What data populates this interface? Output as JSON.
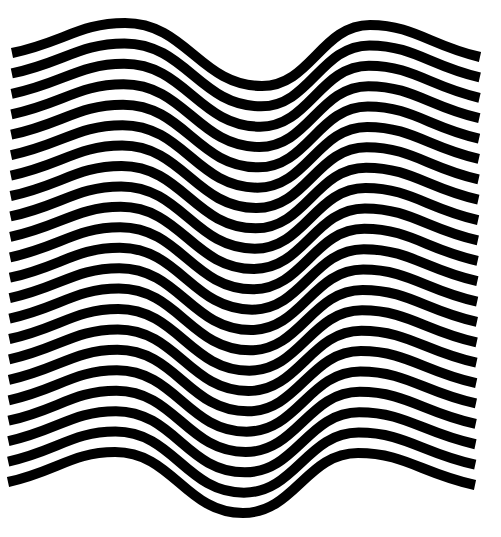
{
  "artwork": {
    "title": "Wavy black stripes op-art pattern",
    "background_color": "#ffffff",
    "stripe_color": "#000000",
    "stripe_count": 22,
    "stroke_width": 10,
    "top_stripe": {
      "start": [
        12,
        53
      ],
      "peak_left": [
        125,
        23
      ],
      "trough": [
        262,
        86
      ],
      "peak_right": [
        370,
        25
      ],
      "end": [
        480,
        57
      ]
    },
    "bottom_stripe": {
      "start": [
        8,
        482
      ],
      "peak_left": [
        115,
        452
      ],
      "trough": [
        243,
        513
      ],
      "peak_right": [
        358,
        453
      ],
      "end": [
        475,
        485
      ]
    }
  }
}
